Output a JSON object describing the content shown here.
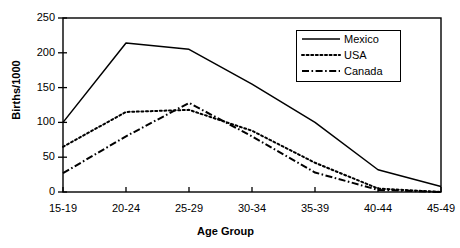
{
  "chart_data": {
    "type": "line",
    "title": "",
    "xlabel": "Age Group",
    "ylabel": "Births/1000",
    "categories": [
      "15-19",
      "20-24",
      "25-29",
      "30-34",
      "35-39",
      "40-44",
      "45-49"
    ],
    "series": [
      {
        "name": "Mexico",
        "style": "solid",
        "color": "#000000",
        "values": [
          100,
          214,
          205,
          155,
          100,
          32,
          8
        ]
      },
      {
        "name": "USA",
        "style": "dotted",
        "color": "#000000",
        "values": [
          65,
          115,
          118,
          88,
          42,
          5,
          0
        ]
      },
      {
        "name": "Canada",
        "style": "dash-dot",
        "color": "#000000",
        "values": [
          27,
          80,
          128,
          80,
          28,
          3,
          0
        ]
      }
    ],
    "ylim": [
      0,
      250
    ],
    "yticks": [
      0,
      50,
      100,
      150,
      200,
      250
    ],
    "ytick_labels": [
      "0",
      "50",
      "100",
      "150",
      "200",
      "250"
    ],
    "grid": false,
    "legend_position": "top-right-inside",
    "axis_color": "#000000",
    "background": "#ffffff"
  }
}
